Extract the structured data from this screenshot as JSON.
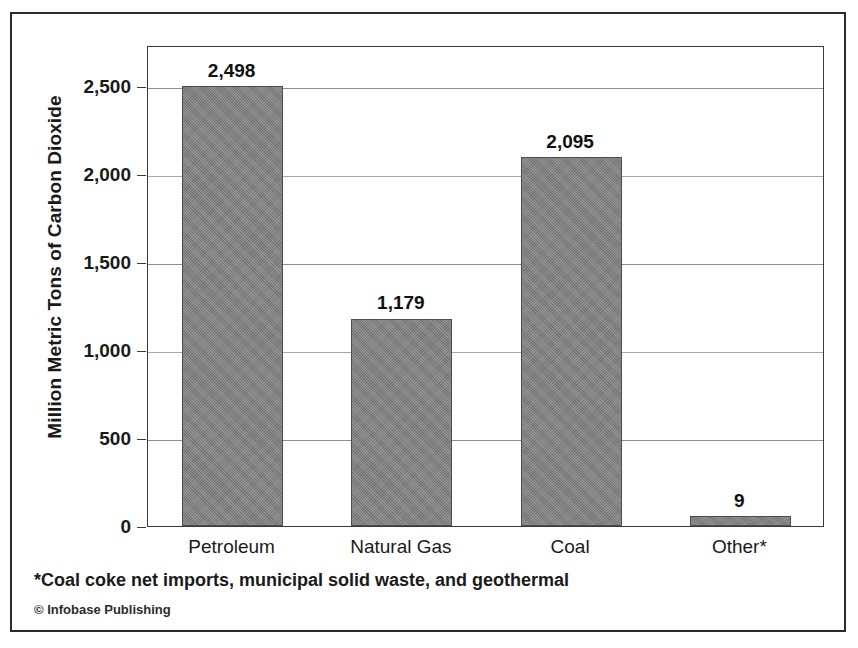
{
  "chart_data": {
    "type": "bar",
    "title": "",
    "xlabel": "",
    "ylabel": "Million Metric Tons of Carbon Dioxide",
    "categories": [
      "Petroleum",
      "Natural Gas",
      "Coal",
      "Other*"
    ],
    "values": [
      2498,
      1179,
      2095,
      9
    ],
    "value_labels": [
      "2,498",
      "1,179",
      "2,095",
      "9"
    ],
    "ylim": [
      0,
      2733
    ],
    "yticks": [
      0,
      500,
      1000,
      1500,
      2000,
      2500
    ],
    "ytick_labels": [
      "0",
      "500",
      "1,000",
      "1,500",
      "2,000",
      "2,500"
    ],
    "grid": true,
    "legend": "none",
    "series": [
      {
        "name": "Carbon dioxide emissions",
        "values": [
          2498,
          1179,
          2095,
          9
        ]
      }
    ],
    "bar_color": "#808080"
  },
  "footnote": "*Coal coke net imports, municipal solid waste, and geothermal",
  "credit": "© Infobase Publishing",
  "colors": {
    "bar": "#808080",
    "border": "#2b2b2b",
    "grid": "#8e8e8e",
    "text": "#1a1a1a"
  }
}
